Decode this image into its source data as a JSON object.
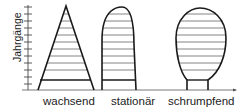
{
  "diagram": {
    "type": "population-pyramids",
    "y_axis_label": "Jahrgänge",
    "shapes": [
      {
        "id": "wachsend",
        "label": "wachsend",
        "form": "triangle"
      },
      {
        "id": "stationaer",
        "label": "stationär",
        "form": "bell"
      },
      {
        "id": "schrumpfend",
        "label": "schrumpfend",
        "form": "bulb"
      }
    ],
    "colors": {
      "line": "#1a1a1a",
      "hatch": "#555555",
      "axis": "#333333"
    }
  }
}
